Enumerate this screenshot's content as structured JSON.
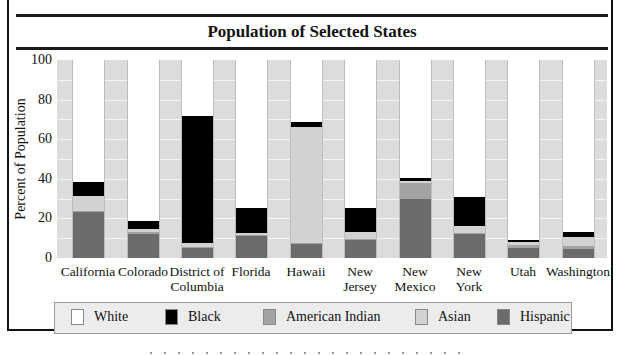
{
  "chart_data": {
    "type": "bar",
    "stacked": true,
    "title": "Population of Selected States",
    "xlabel": "",
    "ylabel": "Percent of Population",
    "ylim": [
      0,
      100
    ],
    "yticks": [
      0,
      20,
      40,
      60,
      80,
      100
    ],
    "grid": true,
    "grid_interval": 10,
    "legend_position": "bottom",
    "categories": [
      "California",
      "Colorado",
      "District of Columbia",
      "Florida",
      "Hawaii",
      "New Jersey",
      "New Mexico",
      "New York",
      "Utah",
      "Washington"
    ],
    "category_labels": [
      [
        "California"
      ],
      [
        "Colorado"
      ],
      [
        "District of",
        "Columbia"
      ],
      [
        "Florida"
      ],
      [
        "Hawaii"
      ],
      [
        "New",
        "Jersey"
      ],
      [
        "New",
        "Mexico"
      ],
      [
        "New",
        "York"
      ],
      [
        "Utah"
      ],
      [
        "Washington"
      ]
    ],
    "series": [
      {
        "name": "Hispanic",
        "color": "#6b6b6b",
        "values": [
          23,
          12,
          5,
          11,
          7,
          9,
          30,
          12,
          5,
          4.5
        ]
      },
      {
        "name": "American Indian",
        "color": "#a3a3a3",
        "values": [
          0.5,
          1,
          0.5,
          0.5,
          0.5,
          0.5,
          8,
          0.5,
          1.5,
          1.5
        ]
      },
      {
        "name": "Asian",
        "color": "#d2d2d2",
        "values": [
          8,
          1.5,
          2,
          1,
          58.5,
          3.5,
          1,
          3.5,
          1.5,
          4.5
        ]
      },
      {
        "name": "Black",
        "color": "#000000",
        "values": [
          7,
          4,
          64,
          13,
          2.5,
          12.5,
          1.5,
          15,
          1,
          2.8
        ]
      },
      {
        "name": "White",
        "color": "#ffffff",
        "values": [
          61.5,
          81.5,
          28.5,
          74.5,
          31.5,
          74.5,
          59.5,
          69,
          91,
          86.7
        ]
      }
    ]
  },
  "legend": [
    {
      "label": "White",
      "color": "#ffffff"
    },
    {
      "label": "Black",
      "color": "#000000"
    },
    {
      "label": "American Indian",
      "color": "#a3a3a3"
    },
    {
      "label": "Asian",
      "color": "#d2d2d2"
    },
    {
      "label": "Hispanic",
      "color": "#6b6b6b"
    }
  ],
  "colors": {
    "plot_background": "#dcdcdc",
    "gridline": "#f4f4f4",
    "legend_background": "#ececec",
    "frame": "#111111"
  }
}
